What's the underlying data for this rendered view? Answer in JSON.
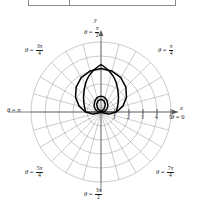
{
  "table": {
    "visible_fragment": true,
    "cells": [
      "",
      ""
    ]
  },
  "figure": {
    "type": "polar-plot",
    "axis_x_label": "x",
    "axis_y_label": "y",
    "curve_color": "#000000",
    "grid_color": "#8c8c8c",
    "axis_color": "#5a5a5a"
  },
  "angle_labels": [
    {
      "id": "theta-0",
      "text_prefix": "θ = ",
      "value": "0",
      "num": "",
      "den": "",
      "x": 172,
      "y": 118
    },
    {
      "id": "theta-pi-4",
      "text_prefix": "θ = ",
      "value": "",
      "num": "π",
      "den": "4",
      "x": 160,
      "y": 49
    },
    {
      "id": "theta-pi-2",
      "text_prefix": "θ = ",
      "value": "",
      "num": "π",
      "den": "2",
      "x": 86,
      "y": 30
    },
    {
      "id": "theta-3pi-4",
      "text_prefix": "θ = ",
      "value": "",
      "num": "3π",
      "den": "4",
      "x": 26,
      "y": 49
    },
    {
      "id": "theta-pi",
      "text_prefix": "θ = ",
      "value": "π",
      "num": "",
      "den": "",
      "x": 8,
      "y": 111
    },
    {
      "id": "theta-5pi-4",
      "text_prefix": "θ = ",
      "value": "",
      "num": "5π",
      "den": "4",
      "x": 26,
      "y": 170
    },
    {
      "id": "theta-3pi-2",
      "text_prefix": "θ = ",
      "value": "",
      "num": "3π",
      "den": "2",
      "x": 86,
      "y": 192
    },
    {
      "id": "theta-7pi-4",
      "text_prefix": "θ = ",
      "value": "",
      "num": "7π",
      "den": "4",
      "x": 158,
      "y": 170
    }
  ],
  "radial_ticks": [
    {
      "label": "1",
      "r": 1,
      "x": 113,
      "y": 113
    },
    {
      "label": "2",
      "r": 2,
      "x": 127,
      "y": 113
    },
    {
      "label": "3",
      "r": 3,
      "x": 141,
      "y": 113
    },
    {
      "label": "4",
      "r": 4,
      "x": 155,
      "y": 113
    },
    {
      "label": "5",
      "r": 5,
      "x": 169,
      "y": 113
    }
  ],
  "chart_data": {
    "type": "line",
    "coordinate_system": "polar",
    "title": "",
    "xlabel": "x",
    "ylabel": "y",
    "equation": "r = a + b sin(θ), limacon with inner loop",
    "curve_name": "limacon-with-inner-loop",
    "orientation": "opens-upward",
    "grid": true,
    "legend": false,
    "r_max": 5,
    "r_tick_step": 1,
    "r_ticks": [
      1,
      2,
      3,
      4,
      5
    ],
    "theta_spokes_deg": [
      0,
      15,
      30,
      45,
      60,
      75,
      90,
      105,
      120,
      135,
      150,
      165,
      180,
      195,
      210,
      225,
      240,
      255,
      270,
      285,
      300,
      315,
      330,
      345
    ],
    "theta_labels_deg": [
      0,
      45,
      90,
      135,
      180,
      225,
      270,
      315
    ],
    "outer_loop_max_r": 3.1,
    "inner_loop_max_r": 0.85,
    "params": {
      "a": 1.1,
      "b": 2.0
    },
    "points_theta_deg": [
      0,
      15,
      30,
      45,
      60,
      75,
      90,
      105,
      120,
      135,
      150,
      165,
      180,
      195,
      210,
      225,
      240,
      255,
      270,
      285,
      300,
      315,
      330,
      345,
      360
    ],
    "points_r": [
      1.1,
      1.62,
      2.1,
      2.51,
      2.83,
      3.03,
      3.1,
      3.03,
      2.83,
      2.51,
      2.1,
      1.62,
      1.1,
      0.58,
      0.1,
      -0.31,
      -0.63,
      -0.83,
      -0.9,
      -0.83,
      -0.63,
      -0.31,
      0.1,
      0.58,
      1.1
    ]
  }
}
